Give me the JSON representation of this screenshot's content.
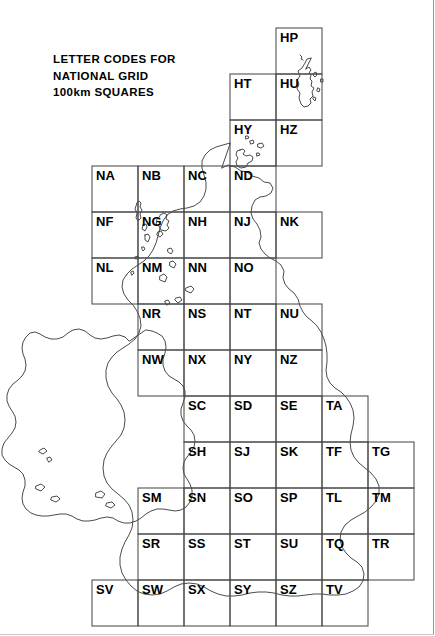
{
  "title": {
    "line1": "LETTER CODES FOR",
    "line2": "NATIONAL GRID",
    "line3": "100km SQUARES"
  },
  "grid": {
    "cell_size_px": 46,
    "origin_x_px": 92,
    "origin_y_px": 28,
    "stroke_color": "#4a4a4a",
    "coast_color": "#2b2b2b",
    "background": "#ffffff"
  },
  "chart_data": {
    "type": "map",
    "title": "LETTER CODES FOR NATIONAL GRID 100km SQUARES",
    "cell_size_km": 100,
    "cells": [
      {
        "code": "HP",
        "col": 4,
        "row": 0
      },
      {
        "code": "HT",
        "col": 3,
        "row": 1
      },
      {
        "code": "HU",
        "col": 4,
        "row": 1
      },
      {
        "code": "HY",
        "col": 3,
        "row": 2
      },
      {
        "code": "HZ",
        "col": 4,
        "row": 2
      },
      {
        "code": "NA",
        "col": 0,
        "row": 3
      },
      {
        "code": "NB",
        "col": 1,
        "row": 3
      },
      {
        "code": "NC",
        "col": 2,
        "row": 3
      },
      {
        "code": "ND",
        "col": 3,
        "row": 3
      },
      {
        "code": "NF",
        "col": 0,
        "row": 4
      },
      {
        "code": "NG",
        "col": 1,
        "row": 4
      },
      {
        "code": "NH",
        "col": 2,
        "row": 4
      },
      {
        "code": "NJ",
        "col": 3,
        "row": 4
      },
      {
        "code": "NK",
        "col": 4,
        "row": 4
      },
      {
        "code": "NL",
        "col": 0,
        "row": 5
      },
      {
        "code": "NM",
        "col": 1,
        "row": 5
      },
      {
        "code": "NN",
        "col": 2,
        "row": 5
      },
      {
        "code": "NO",
        "col": 3,
        "row": 5
      },
      {
        "code": "NR",
        "col": 1,
        "row": 6
      },
      {
        "code": "NS",
        "col": 2,
        "row": 6
      },
      {
        "code": "NT",
        "col": 3,
        "row": 6
      },
      {
        "code": "NU",
        "col": 4,
        "row": 6
      },
      {
        "code": "NW",
        "col": 1,
        "row": 7
      },
      {
        "code": "NX",
        "col": 2,
        "row": 7
      },
      {
        "code": "NY",
        "col": 3,
        "row": 7
      },
      {
        "code": "NZ",
        "col": 4,
        "row": 7
      },
      {
        "code": "SC",
        "col": 2,
        "row": 8
      },
      {
        "code": "SD",
        "col": 3,
        "row": 8
      },
      {
        "code": "SE",
        "col": 4,
        "row": 8
      },
      {
        "code": "TA",
        "col": 5,
        "row": 8
      },
      {
        "code": "SH",
        "col": 2,
        "row": 9
      },
      {
        "code": "SJ",
        "col": 3,
        "row": 9
      },
      {
        "code": "SK",
        "col": 4,
        "row": 9
      },
      {
        "code": "TF",
        "col": 5,
        "row": 9
      },
      {
        "code": "TG",
        "col": 6,
        "row": 9
      },
      {
        "code": "SM",
        "col": 1,
        "row": 10
      },
      {
        "code": "SN",
        "col": 2,
        "row": 10
      },
      {
        "code": "SO",
        "col": 3,
        "row": 10
      },
      {
        "code": "SP",
        "col": 4,
        "row": 10
      },
      {
        "code": "TL",
        "col": 5,
        "row": 10
      },
      {
        "code": "TM",
        "col": 6,
        "row": 10
      },
      {
        "code": "SR",
        "col": 1,
        "row": 11
      },
      {
        "code": "SS",
        "col": 2,
        "row": 11
      },
      {
        "code": "ST",
        "col": 3,
        "row": 11
      },
      {
        "code": "SU",
        "col": 4,
        "row": 11
      },
      {
        "code": "TQ",
        "col": 5,
        "row": 11
      },
      {
        "code": "TR",
        "col": 6,
        "row": 11
      },
      {
        "code": "SV",
        "col": 0,
        "row": 12
      },
      {
        "code": "SW",
        "col": 1,
        "row": 12
      },
      {
        "code": "SX",
        "col": 2,
        "row": 12
      },
      {
        "code": "SY",
        "col": 3,
        "row": 12
      },
      {
        "code": "SZ",
        "col": 4,
        "row": 12
      },
      {
        "code": "TV",
        "col": 5,
        "row": 12
      }
    ]
  }
}
